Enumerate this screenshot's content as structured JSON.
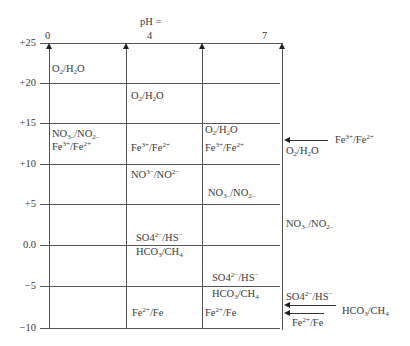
{
  "header": {
    "ph_title": "pH =",
    "ph_ticks": [
      {
        "label": "0",
        "x": 45
      },
      {
        "label": "4",
        "x": 147
      },
      {
        "label": "7",
        "x": 262
      }
    ]
  },
  "y_axis": {
    "ticks": [
      {
        "label": "+25",
        "y": 43
      },
      {
        "label": "+20",
        "y": 83
      },
      {
        "label": "+15",
        "y": 123
      },
      {
        "label": "+10",
        "y": 164
      },
      {
        "label": "+5",
        "y": 204
      },
      {
        "label": "0.0",
        "y": 245
      },
      {
        "label": "−5",
        "y": 286
      },
      {
        "label": "−10",
        "y": 328
      }
    ]
  },
  "columns": {
    "ph0": [
      {
        "text": "O₂/H₂O",
        "html": "O<sub>2</sub>/H<sub>2</sub>O",
        "x": 52,
        "y": 63
      },
      {
        "text": "NO₃⁻/NO₂⁻",
        "html": "NO<sub>3&ndash;</sub>/NO<sub>2&ndash;</sub>",
        "x": 52,
        "y": 128
      },
      {
        "text": "Fe³⁺/Fe²⁺",
        "html": "Fe<sup>3+</sup>/Fe<sup>2+</sup>",
        "x": 52,
        "y": 141
      }
    ],
    "ph4": [
      {
        "text": "O₂/H₂O",
        "html": "O<sub>2</sub>/H<sub>2</sub>O",
        "x": 131,
        "y": 90
      },
      {
        "text": "Fe³⁺/Fe²⁺",
        "html": "Fe<sup>3+</sup>/Fe<sup>2+</sup>",
        "x": 131,
        "y": 142
      },
      {
        "text": "NO³⁻/NO²⁻",
        "html": "NO<sup>3&minus;</sup>/NO<sup>2&minus;</sup>",
        "x": 131,
        "y": 169
      },
      {
        "text": "SO4²⁻/HS⁻",
        "html": "SO4<sup>2&minus;</sup>/HS<sup>&minus;</sup>",
        "x": 136,
        "y": 232
      },
      {
        "text": "HCO₃/CH₄",
        "html": "HCO<sub>3</sub>/CH<sub>4</sub>",
        "x": 136,
        "y": 246
      },
      {
        "text": "Fe²⁺/Fe",
        "html": "Fe<sup>2+</sup>/Fe",
        "x": 132,
        "y": 307
      }
    ],
    "ph7": [
      {
        "text": "O₂/H₂O",
        "html": "O<sub>2</sub>/H<sub>2</sub>O",
        "x": 205,
        "y": 124
      },
      {
        "text": "Fe³⁺/Fe²⁺",
        "html": "Fe<sup>3+</sup>/Fe<sup>2+</sup>",
        "x": 205,
        "y": 142
      },
      {
        "text": "NO₃⁻/NO₂⁻",
        "html": "NO<sub>3&ndash;</sub>/NO<sub>2&ndash;</sub>",
        "x": 208,
        "y": 187
      },
      {
        "text": "SO4²⁻/HS⁻",
        "html": "SO4<sup>2&minus;</sup>/HS<sup>&minus;</sup>",
        "x": 212,
        "y": 272
      },
      {
        "text": "HCO₃/CH₄",
        "html": "HCO<sub>3</sub>/CH<sub>4</sub>",
        "x": 212,
        "y": 288
      },
      {
        "text": "Fe²⁺/Fe",
        "html": "Fe<sup>2+</sup>/Fe",
        "x": 205,
        "y": 307
      }
    ],
    "right": [
      {
        "text": "Fe³⁺/Fe²⁺",
        "html": "Fe<sup>3+</sup>/Fe<sup>2+</sup>",
        "x": 335,
        "y": 134
      },
      {
        "text": "O₂/H₂O",
        "html": "O<sub>2</sub>/H<sub>2</sub>O",
        "x": 286,
        "y": 145
      },
      {
        "text": "NO₃⁻/NO₂⁻",
        "html": "NO<sub>3&ndash;</sub>/NO<sub>2&ndash;</sub>",
        "x": 286,
        "y": 218
      },
      {
        "text": "SO4²⁻/HS⁻",
        "html": "SO4<sup>2&minus;</sup>/HS<sup>&minus;</sup>",
        "x": 286,
        "y": 291
      },
      {
        "text": "HCO₃/CH₄",
        "html": "HCO<sub>3</sub>/CH<sub>4</sub>",
        "x": 342,
        "y": 305
      },
      {
        "text": "Fe²⁺/Fe",
        "html": "Fe<sup>2+</sup>/Fe",
        "x": 292,
        "y": 317
      }
    ]
  },
  "arrows": [
    {
      "name": "fe3-fe2-arrow",
      "y": 140,
      "x1": 283,
      "x2": 328
    },
    {
      "name": "hco3-ch4-arrow",
      "y": 305,
      "x1": 283,
      "x2": 336
    },
    {
      "name": "fe2-fe-arrow",
      "y": 313,
      "x1": 283,
      "x2": 324
    }
  ],
  "colors": {
    "line": "#555555",
    "text": "#3a3a3a",
    "background": "#ffffff"
  }
}
